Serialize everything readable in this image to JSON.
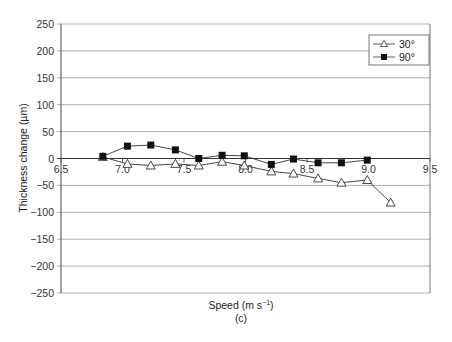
{
  "chart_data": {
    "type": "line",
    "title": "",
    "xlabel": "Speed (m s⁻¹)",
    "ylabel": "Thickness change (µm)",
    "caption": "(c)",
    "xlim": [
      6.5,
      9.5
    ],
    "ylim": [
      -250,
      250
    ],
    "x_ticks": [
      "6.5",
      "7.0",
      "7.5",
      "8.0",
      "8.5",
      "9.0",
      "9.5"
    ],
    "y_ticks": [
      "250",
      "200",
      "150",
      "100",
      "50",
      "0",
      "−50",
      "−100",
      "−150",
      "−200",
      "−250"
    ],
    "grid": "horizontal",
    "legend_position": "top-right",
    "series": [
      {
        "name": "30°",
        "marker": "open-triangle",
        "x": [
          6.84,
          7.04,
          7.23,
          7.43,
          7.62,
          7.81,
          7.99,
          8.21,
          8.39,
          8.59,
          8.78,
          8.99,
          9.18
        ],
        "values": [
          3,
          -10,
          -13,
          -10,
          -13,
          -6,
          -13,
          -24,
          -28,
          -37,
          -45,
          -40,
          -82
        ]
      },
      {
        "name": "90°",
        "marker": "filled-square",
        "x": [
          6.84,
          7.04,
          7.23,
          7.43,
          7.62,
          7.81,
          7.99,
          8.21,
          8.39,
          8.59,
          8.78,
          8.99
        ],
        "values": [
          4,
          23,
          25,
          16,
          0,
          6,
          5,
          -11,
          -1,
          -8,
          -8,
          -3
        ]
      }
    ]
  },
  "legend": {
    "items": [
      "30°",
      "90°"
    ]
  },
  "axis": {
    "xlabel": "Speed (m s",
    "xlabel_sup": "−1",
    "xlabel_end": ")",
    "ylabel": "Thickness change (µm)",
    "caption": "(c)"
  }
}
